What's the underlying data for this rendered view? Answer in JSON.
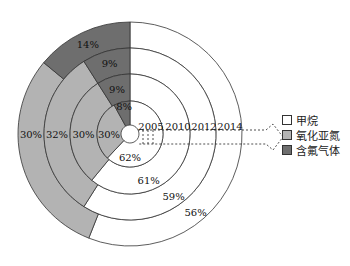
{
  "chart_data": {
    "type": "nested-donut",
    "title": "",
    "center": [
      130,
      134
    ],
    "rings": [
      {
        "year": "2005",
        "r_in": 9,
        "r_out": 33,
        "series_values": {
          "甲烷": 62,
          "氧化亚氮": 30,
          "含氟气体": 8
        }
      },
      {
        "year": "2010",
        "r_in": 33,
        "r_out": 60,
        "series_values": {
          "甲烷": 61,
          "氧化亚氮": 30,
          "含氟气体": 9
        }
      },
      {
        "year": "2012",
        "r_in": 60,
        "r_out": 86,
        "series_values": {
          "甲烷": 59,
          "氧化亚氮": 32,
          "含氟气体": 9
        }
      },
      {
        "year": "2014",
        "r_in": 86,
        "r_out": 112,
        "series_values": {
          "甲烷": 56,
          "氧化亚氮": 30,
          "含氟气体": 14
        }
      }
    ],
    "series": [
      {
        "name": "甲烷",
        "color": "#ffffff",
        "values": [
          62,
          61,
          59,
          56
        ]
      },
      {
        "name": "氧化亚氮",
        "color": "#b3b3b3",
        "values": [
          30,
          30,
          32,
          30
        ]
      },
      {
        "name": "含氟气体",
        "color": "#6e6e6e",
        "values": [
          8,
          9,
          9,
          14
        ]
      }
    ],
    "categories": [
      "2005",
      "2010",
      "2012",
      "2014"
    ],
    "unit": "%",
    "legend_position": "right"
  },
  "legend": [
    {
      "label": "甲烷",
      "color": "#ffffff"
    },
    {
      "label": "氧化亚氮",
      "color": "#b3b3b3"
    },
    {
      "label": "含氟气体",
      "color": "#6e6e6e"
    }
  ]
}
